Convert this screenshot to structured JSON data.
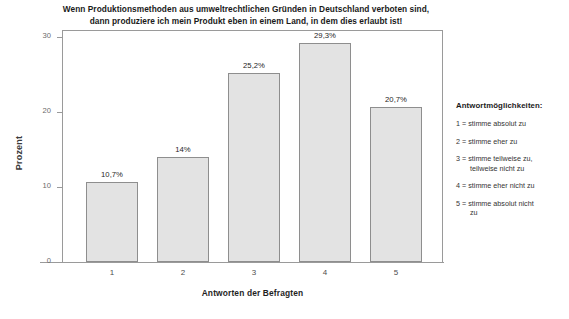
{
  "chart_data": {
    "type": "bar",
    "title": "Wenn Produktionsmethoden aus umweltrechtlichen Gründen in Deutschland verboten sind, dann produziere ich mein Produkt eben in einem Land, in dem dies erlaubt ist!",
    "title_lines": [
      "Wenn Produktionsmethoden aus umweltrechtlichen Gründen in Deutschland verboten sind,",
      "dann produziere ich mein Produkt eben in einem Land, in dem dies erlaubt ist!"
    ],
    "categories": [
      "1",
      "2",
      "3",
      "4",
      "5"
    ],
    "values": [
      10.7,
      14.0,
      25.2,
      29.3,
      20.7
    ],
    "data_labels": [
      "10,7%",
      "14%",
      "25,2%",
      "29,3%",
      "20,7%"
    ],
    "xlabel": "Antworten der Befragten",
    "ylabel": "Prozent",
    "ylim": [
      0,
      31
    ],
    "yticks": [
      0,
      10,
      20,
      30
    ],
    "ytick_labels": [
      "0",
      "10",
      "20",
      "30"
    ],
    "grid": false,
    "legend_position": "right-outside",
    "bar_fill_color": "#e3e3e3",
    "bar_border_color": "#8e8e8e",
    "axis_color": "#9a9a9a"
  },
  "legend": {
    "heading": "Antwortmöglichkeiten:",
    "items": [
      {
        "first": "1 = stimme absolut zu",
        "second": ""
      },
      {
        "first": "2 = stimme eher zu",
        "second": ""
      },
      {
        "first": "3 = stimme teilweise zu,",
        "second": "teilweise nicht zu"
      },
      {
        "first": "4 = stimme eher nicht zu",
        "second": ""
      },
      {
        "first": "5 = stimme absolut nicht",
        "second": "zu"
      }
    ]
  }
}
